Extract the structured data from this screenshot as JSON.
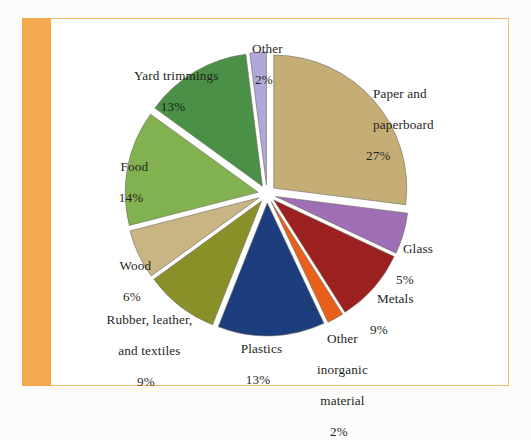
{
  "figure": {
    "background_color": "#fdfcfa",
    "panel_color": "#ffffff",
    "border_color": "#f5ba6a",
    "accent_bar_color": "#f5a94e"
  },
  "chart_data": {
    "type": "pie",
    "title": "",
    "subtitle": "",
    "xlabel": "",
    "ylabel": "",
    "legend_position": "none",
    "grid": false,
    "labels_inline": true,
    "start_angle_deg": 0,
    "direction": "clockwise",
    "explode": true,
    "units": "percent",
    "categories": [
      "Paper and paperboard",
      "Glass",
      "Metals",
      "Other inorganic material",
      "Plastics",
      "Rubber, leather, and textiles",
      "Wood",
      "Food",
      "Yard trimmings",
      "Other"
    ],
    "values": [
      27,
      5,
      9,
      2,
      13,
      9,
      6,
      14,
      13,
      2
    ],
    "colors": [
      "#c4ae76",
      "#9e6fb5",
      "#9c2020",
      "#e8601c",
      "#1c3d7e",
      "#8a9028",
      "#c9b583",
      "#82b24f",
      "#4a9147",
      "#b0a8d8"
    ],
    "slices": [
      {
        "name": "Paper and paperboard",
        "value": 27,
        "value_label": "27%",
        "label_line1": "Paper and",
        "label_line2": "paperboard",
        "color": "#c4ae76"
      },
      {
        "name": "Glass",
        "value": 5,
        "value_label": "5%",
        "label_line1": "Glass",
        "label_line2": "",
        "color": "#9e6fb5"
      },
      {
        "name": "Metals",
        "value": 9,
        "value_label": "9%",
        "label_line1": "Metals",
        "label_line2": "",
        "color": "#9c2020"
      },
      {
        "name": "Other inorganic material",
        "value": 2,
        "value_label": "2%",
        "label_line1": "Other",
        "label_line2": "inorganic",
        "label_line3": "material",
        "color": "#e8601c",
        "has_leader_line": true
      },
      {
        "name": "Plastics",
        "value": 13,
        "value_label": "13%",
        "label_line1": "Plastics",
        "label_line2": "",
        "color": "#1c3d7e"
      },
      {
        "name": "Rubber, leather, and textiles",
        "value": 9,
        "value_label": "9%",
        "label_line1": "Rubber, leather,",
        "label_line2": "and textiles",
        "color": "#8a9028"
      },
      {
        "name": "Wood",
        "value": 6,
        "value_label": "6%",
        "label_line1": "Wood",
        "label_line2": "",
        "color": "#c9b583"
      },
      {
        "name": "Food",
        "value": 14,
        "value_label": "14%",
        "label_line1": "Food",
        "label_line2": "",
        "color": "#82b24f"
      },
      {
        "name": "Yard trimmings",
        "value": 13,
        "value_label": "13%",
        "label_line1": "Yard trimmings",
        "label_line2": "",
        "color": "#4a9147"
      },
      {
        "name": "Other",
        "value": 2,
        "value_label": "2%",
        "label_line1": "Other",
        "label_line2": "",
        "color": "#b0a8d8"
      }
    ]
  }
}
